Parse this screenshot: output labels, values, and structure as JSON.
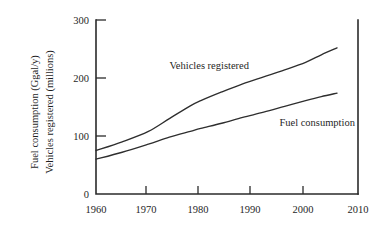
{
  "chart_data": {
    "type": "line",
    "title": "",
    "xlabel": "",
    "ylabel_line1": "Fuel consumption (Ggal/y)",
    "ylabel_line2": "Vehicles registered (millions)",
    "xlim": [
      1960,
      2010
    ],
    "ylim": [
      0,
      300
    ],
    "xticks": [
      1960,
      1970,
      1980,
      1990,
      2000,
      2010
    ],
    "yticks": [
      0,
      100,
      200,
      300
    ],
    "xtick_labels": [
      "1960",
      "1970",
      "1980",
      "1990",
      "2000",
      "2010"
    ],
    "ytick_labels": [
      "0",
      "100",
      "200",
      "300"
    ],
    "grid": false,
    "legend": "inline-annotations",
    "series": [
      {
        "name": "Vehicles registered",
        "units": "millions",
        "annotation": "Vehicles registered",
        "x": [
          1960,
          1965,
          1970,
          1974,
          1978,
          1980,
          1984,
          1988,
          1992,
          1996,
          2000,
          2003,
          2006
        ],
        "values": [
          75,
          90,
          108,
          130,
          152,
          161,
          176,
          190,
          202,
          214,
          227,
          240,
          252
        ]
      },
      {
        "name": "Fuel consumption",
        "units": "Ggal/y",
        "annotation": "Fuel consumption",
        "x": [
          1960,
          1965,
          1970,
          1974,
          1978,
          1980,
          1984,
          1988,
          1992,
          1996,
          2000,
          2003,
          2006
        ],
        "values": [
          60,
          72,
          86,
          98,
          108,
          113,
          122,
          132,
          141,
          151,
          161,
          168,
          174
        ]
      }
    ],
    "annotations": [
      {
        "text": "Vehicles registered",
        "x": 1974,
        "y": 215
      },
      {
        "text": "Fuel consumption",
        "x": 1995,
        "y": 118
      }
    ],
    "colors": {
      "axis": "#2b2b2b",
      "series": "#2e2e2e",
      "background": "#ffffff"
    }
  }
}
